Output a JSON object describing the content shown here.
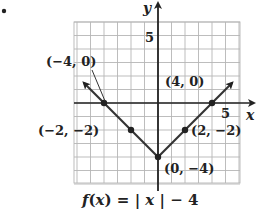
{
  "bullet": "•",
  "chart_data": {
    "type": "line",
    "function": "f(x) = |x| - 4",
    "xlabel": "x",
    "ylabel": "y",
    "xlim": [
      -6,
      6
    ],
    "ylim": [
      -6,
      6
    ],
    "grid": true,
    "tick_labels": {
      "x": [
        "5"
      ],
      "y": [
        "5"
      ]
    },
    "series": [
      {
        "name": "f(x) = |x| - 4",
        "x": [
          -5.5,
          -4,
          -2,
          0,
          2,
          4,
          5.5
        ],
        "y": [
          1.5,
          0,
          -2,
          -4,
          -2,
          0,
          1.5
        ]
      }
    ],
    "points": [
      {
        "x": -4,
        "y": 0,
        "label": "(−4, 0)"
      },
      {
        "x": -2,
        "y": -2,
        "label": "(−2, −2)"
      },
      {
        "x": 0,
        "y": -4,
        "label": "(0, −4)"
      },
      {
        "x": 2,
        "y": -2,
        "label": "(2, −2)"
      },
      {
        "x": 4,
        "y": 0,
        "label": "(4, 0)"
      }
    ],
    "colors": {
      "line": "#333333",
      "grid": "#b5b5b5",
      "axis": "#222222"
    }
  }
}
